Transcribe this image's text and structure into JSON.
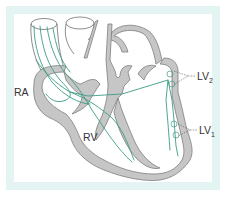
{
  "figure": {
    "colors": {
      "frame": "#e4f4f2",
      "wall_fill": "#c6c6c6",
      "wall_stroke": "#7d7d7d",
      "conduction": "#3d9c86",
      "label": "#333333"
    }
  },
  "labels": {
    "ra": "RA",
    "rv": "RV",
    "lv2_main": "LV",
    "lv2_sub": "2",
    "lv1_main": "LV",
    "lv1_sub": "1"
  }
}
